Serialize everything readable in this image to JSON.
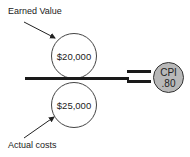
{
  "numerator": {
    "label": "Earned Value",
    "value": "$20,000"
  },
  "denominator": {
    "label": "Actual costs",
    "value": "$25,000"
  },
  "result": {
    "title": "CPI",
    "value": ".80"
  },
  "colors": {
    "cpi_fill": "#b8b8b8",
    "line": "#1a1a1a"
  }
}
